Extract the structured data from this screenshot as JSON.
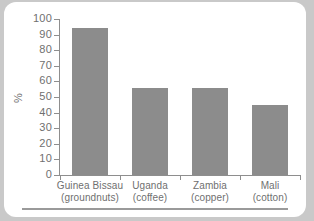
{
  "chart_data": {
    "type": "bar",
    "title": "",
    "xlabel": "",
    "ylabel": "%",
    "ylim": [
      0,
      100
    ],
    "ytick_step": 10,
    "yticks": [
      100,
      90,
      80,
      70,
      60,
      50,
      40,
      30,
      20,
      10,
      0
    ],
    "grid": false,
    "legend": null,
    "categories": [
      "Guinea Bissau (groundnuts)",
      "Uganda (coffee)",
      "Zambia (copper)",
      "Mali (cotton)"
    ],
    "category_lines": [
      {
        "country": "Guinea Bissau",
        "commodity": "(groundnuts)"
      },
      {
        "country": "Uganda",
        "commodity": "(coffee)"
      },
      {
        "country": "Zambia",
        "commodity": "(copper)"
      },
      {
        "country": "Mali",
        "commodity": "(cotton)"
      }
    ],
    "values": [
      94,
      56,
      56,
      45
    ],
    "bar_color": "#8c8c8c",
    "axis_color": "#8e8e8e",
    "text_color": "#6f6f6f",
    "background_color": "#ffffff",
    "page_color": "#c9c9c9"
  }
}
